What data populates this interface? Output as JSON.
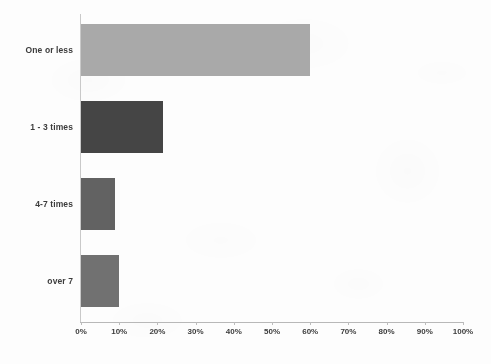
{
  "chart_data": {
    "type": "bar",
    "orientation": "horizontal",
    "title": "",
    "subtitle": "",
    "xlabel": "",
    "ylabel": "",
    "categories": [
      "One or less",
      "1 - 3 times",
      "4-7 times",
      "over 7"
    ],
    "values": [
      60,
      21.5,
      9,
      10
    ],
    "value_unit": "%",
    "xlim": [
      0,
      100
    ],
    "x_ticks": [
      0,
      10,
      20,
      30,
      40,
      50,
      60,
      70,
      80,
      90,
      100
    ],
    "x_tick_labels": [
      "0%",
      "10%",
      "20%",
      "30%",
      "40%",
      "50%",
      "60%",
      "70%",
      "80%",
      "90%",
      "100%"
    ],
    "grid": false,
    "legend": false,
    "legend_position": "none",
    "bar_colors": [
      "#a9a9a9",
      "#454545",
      "#626262",
      "#717171"
    ],
    "series": [
      {
        "name": "",
        "values": [
          60,
          21.5,
          9,
          10
        ]
      }
    ],
    "annotations": []
  },
  "axis": {
    "axis_line_color": "#b8b8b8",
    "tick_color": "#bcbcbc",
    "label_color": "#3c3c3c"
  },
  "background": {
    "page_color": "#fdfdfd"
  }
}
